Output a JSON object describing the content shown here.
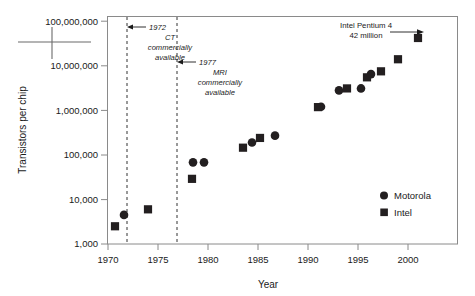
{
  "chart_data": {
    "type": "scatter",
    "title": "",
    "xlabel": "Year",
    "ylabel": "Transistors per chip",
    "xlim": [
      1969.5,
      2004.5
    ],
    "ylim": [
      1000,
      100000000
    ],
    "yscale": "log",
    "grid": false,
    "xticks": [
      1970,
      1975,
      1980,
      1985,
      1990,
      1995,
      2000
    ],
    "xticklabels": [
      "1970",
      "1975",
      "1980",
      "1985",
      "1990",
      "1995",
      "2000"
    ],
    "yticks": [
      1000,
      10000,
      100000,
      1000000,
      10000000,
      100000000
    ],
    "yticklabels": [
      "1,000",
      "10,000",
      "100,000",
      "1,000,000",
      "10,000,000",
      "100,000,000"
    ],
    "legend_position": "lower right",
    "series": [
      {
        "name": "Motorola",
        "marker": "circle",
        "color": "#231f20",
        "points": [
          {
            "x": 1971.6,
            "y": 4500
          },
          {
            "x": 1978.5,
            "y": 68000
          },
          {
            "x": 1979.6,
            "y": 68000
          },
          {
            "x": 1984.4,
            "y": 190000
          },
          {
            "x": 1986.7,
            "y": 270000
          },
          {
            "x": 1991.3,
            "y": 1200000
          },
          {
            "x": 1993.1,
            "y": 2800000
          },
          {
            "x": 1995.3,
            "y": 3100000
          },
          {
            "x": 1996.3,
            "y": 6500000
          }
        ]
      },
      {
        "name": "Intel",
        "marker": "square",
        "color": "#231f20",
        "points": [
          {
            "x": 1970.7,
            "y": 2500
          },
          {
            "x": 1974.0,
            "y": 6000
          },
          {
            "x": 1978.4,
            "y": 29000
          },
          {
            "x": 1983.5,
            "y": 145000
          },
          {
            "x": 1985.2,
            "y": 240000
          },
          {
            "x": 1991.0,
            "y": 1180000
          },
          {
            "x": 1993.9,
            "y": 3100000
          },
          {
            "x": 1995.9,
            "y": 5500000
          },
          {
            "x": 1997.3,
            "y": 7500000
          },
          {
            "x": 1999.0,
            "y": 14000000
          },
          {
            "x": 2001.0,
            "y": 42000000
          }
        ]
      }
    ],
    "annotations": [
      {
        "id": "ct-event",
        "vline_year": 1972,
        "lines": [
          "1972",
          "CT",
          "commercially",
          "available"
        ],
        "style": "italic",
        "arrow": "left"
      },
      {
        "id": "mri-event",
        "vline_year": 1977,
        "lines": [
          "1977",
          "MRI",
          "commercially",
          "available"
        ],
        "style": "italic",
        "arrow": "left"
      },
      {
        "id": "pentium4-callout",
        "lines": [
          "Intel Pentium 4",
          "42 million"
        ],
        "style": "plain",
        "arrow": "right",
        "target_year": 2001,
        "target_value": 42000000
      }
    ]
  },
  "legend": {
    "entries": [
      {
        "label": "Motorola",
        "marker": "circle"
      },
      {
        "label": "Intel",
        "marker": "square"
      }
    ]
  },
  "axes": {
    "x_title": "Year",
    "y_title": "Transistors per chip",
    "x_labels": [
      "1970",
      "1975",
      "1980",
      "1985",
      "1990",
      "1995",
      "2000"
    ],
    "y_labels": [
      "100,000,000",
      "10,000,000",
      "1,000,000",
      "100,000",
      "10,000",
      "1,000"
    ]
  },
  "annotations_text": {
    "ct": {
      "l1": "1972",
      "l2": "CT",
      "l3": "commercially",
      "l4": "available"
    },
    "mri": {
      "l1": "1977",
      "l2": "MRI",
      "l3": "commercially",
      "l4": "available"
    },
    "pentium": {
      "l1": "Intel Pentium 4",
      "l2": "42 million"
    }
  },
  "colors": {
    "marker": "#231f20",
    "axis": "#808080",
    "dashed": "#333333",
    "text": "#1a1a1a"
  }
}
